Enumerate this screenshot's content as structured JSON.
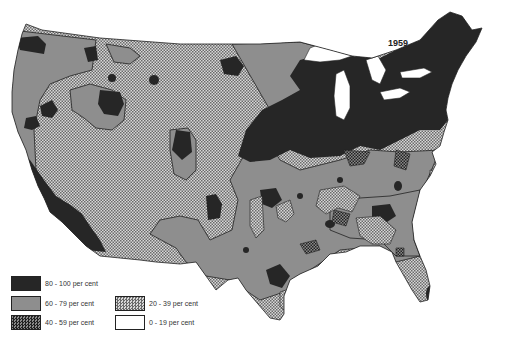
{
  "map": {
    "title": "1959",
    "region": "Contiguous United States",
    "colors": {
      "c80_100": "#262626",
      "c60_79": "#8e8e8e",
      "c40_59": "crosshatch-dark",
      "c20_39": "crosshatch-light",
      "c0_19": "#ffffff"
    }
  },
  "legend": {
    "items": [
      {
        "label": "80 - 100 per cent",
        "pattern": "solid-black"
      },
      {
        "label": "60 - 79 per cent",
        "pattern": "solid-gray"
      },
      {
        "label": "40 - 59 per cent",
        "pattern": "dark-crosshatch"
      },
      {
        "label": "20 - 39 per cent",
        "pattern": "light-crosshatch"
      },
      {
        "label": "0 - 19 per cent",
        "pattern": "white"
      }
    ]
  }
}
